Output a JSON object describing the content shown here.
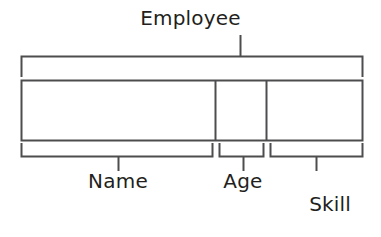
{
  "diagram": {
    "kind": "record-structure-diagram",
    "title": "Employee",
    "stroke_color": "#4d4d4f",
    "text_color": "#231f20",
    "background_color": "#ffffff",
    "top_bracket": {
      "label": "Employee",
      "covers": [
        "Name",
        "Age",
        "Skill Rating"
      ]
    },
    "fields": [
      {
        "label": "Name",
        "cell_index": 0
      },
      {
        "label": "Age",
        "cell_index": 1
      },
      {
        "label_line_1": "Skill",
        "label_line_2": "Rating",
        "label": "Skill Rating",
        "cell_index": 2
      }
    ]
  }
}
